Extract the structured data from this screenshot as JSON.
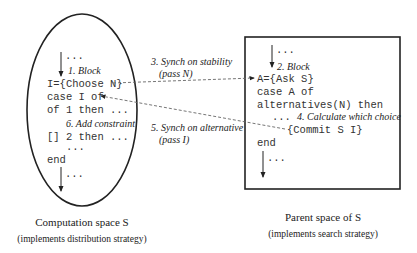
{
  "left": {
    "title": "Computation space S",
    "subtitle": "(implements distribution strategy)",
    "dots_top": "...",
    "step1": "1. Block",
    "code": [
      "I={Choose N}",
      "case I of",
      "of 1 then ...",
      "[] 2 then ...",
      "end"
    ],
    "step6": "6. Add constraint",
    "dots_mid": "...",
    "dots_bottom": "..."
  },
  "right": {
    "title": "Parent space of S",
    "subtitle": "(implements search strategy)",
    "dots_top": "...",
    "step2": "2. Block",
    "code": [
      "A={Ask S}",
      "case A of",
      "alternatives(N) then",
      "{Commit S I}",
      "end"
    ],
    "dots_mid": "...",
    "step4": "4. Calculate which choice",
    "dots_bottom": "..."
  },
  "arrows": {
    "step3_line1": "3. Synch on stability",
    "step3_line2": "(pass N)",
    "step5_line1": "5. Synch on alternative",
    "step5_line2": "(pass I)"
  },
  "colors": {
    "stroke": "#222222",
    "dashed": "#666666"
  }
}
